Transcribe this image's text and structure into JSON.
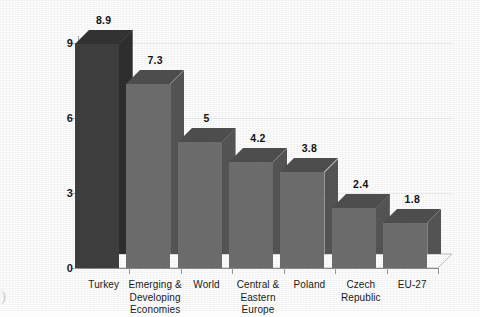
{
  "chart_data": {
    "type": "bar",
    "title": "",
    "subtitle": "",
    "xlabel": "",
    "ylabel": "",
    "categories": [
      "Turkey",
      "Emerging &\nDeveloping\nEconomies",
      "World",
      "Central &\nEastern Europe",
      "Poland",
      "Czech Republic",
      "EU-27"
    ],
    "values": [
      8.9,
      7.3,
      5,
      4.2,
      3.8,
      2.4,
      1.8
    ],
    "value_labels": [
      "8.9",
      "7.3",
      "5",
      "4.2",
      "3.8",
      "2.4",
      "1.8"
    ],
    "ylim": [
      0,
      9.7
    ],
    "yticks": [
      0,
      3,
      6,
      9
    ],
    "ytick_labels": [
      "0",
      "3",
      "6",
      "9"
    ],
    "grid": true,
    "legend": false,
    "legend_position": "none",
    "style_3d": true,
    "highlight_index": 0,
    "colors": {
      "bar_front": "#6e6e6e",
      "bar_side": "#555555",
      "bar_top": "#4f4f4f",
      "bar_front_highlight": "#3f3f3f",
      "bar_side_highlight": "#2f2f2f",
      "bar_top_highlight": "#333333",
      "axis": "#9a9a9a",
      "gridline": "#ededed",
      "text": "#1b1b1b",
      "background": "#fdfdfd"
    }
  },
  "artifacts": {
    "corner_mark": ")"
  }
}
